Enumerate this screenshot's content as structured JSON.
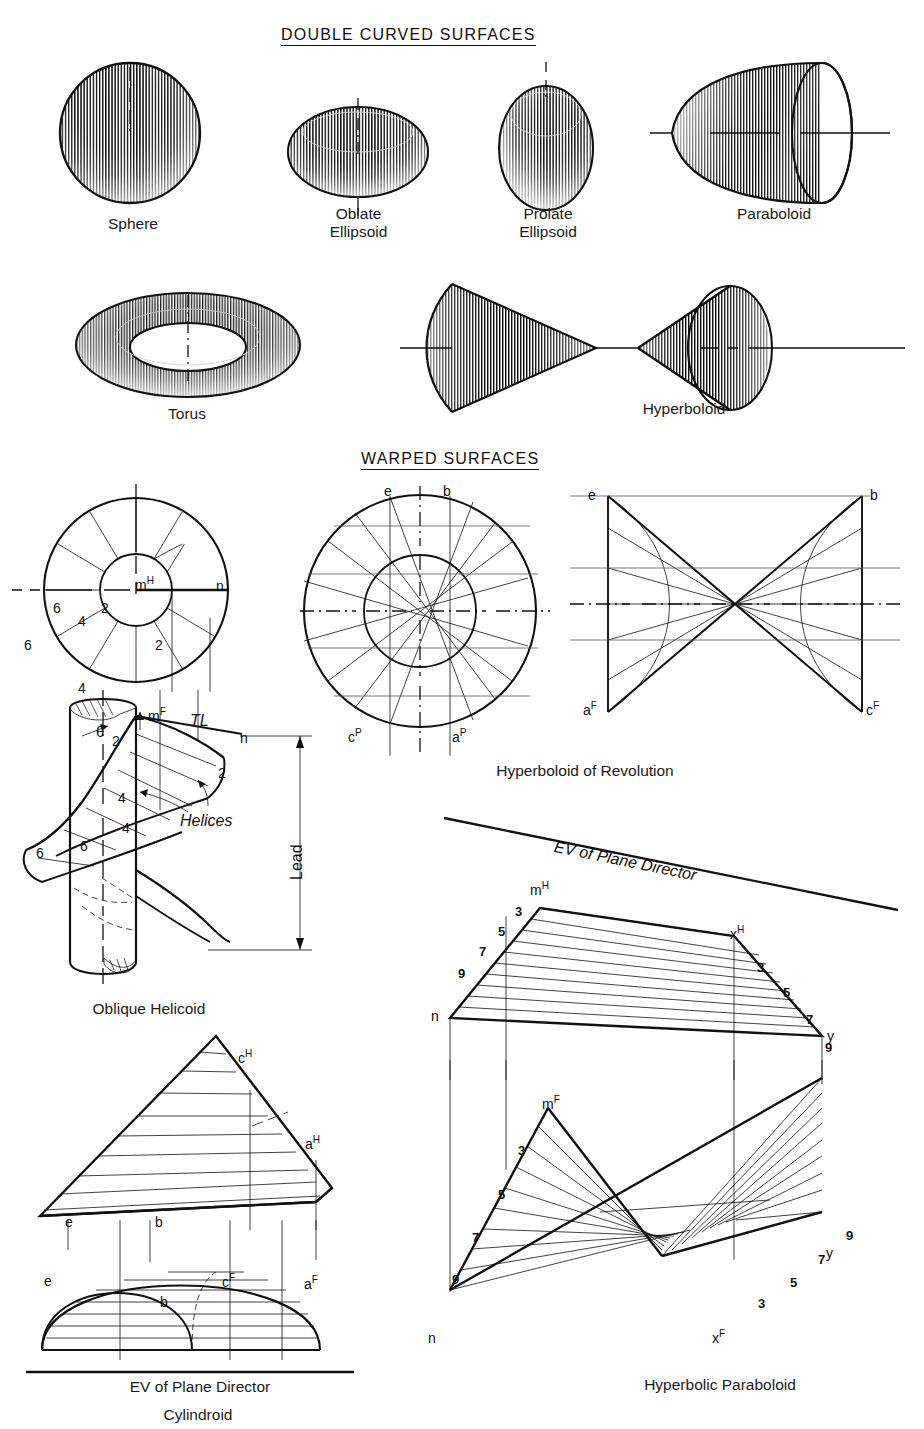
{
  "page": {
    "sections": [
      {
        "id": "double-curved",
        "title": "DOUBLE CURVED SURFACES"
      },
      {
        "id": "warped",
        "title": "WARPED SURFACES"
      }
    ]
  },
  "double_curved": {
    "title": "DOUBLE CURVED SURFACES",
    "figures": [
      {
        "name": "sphere",
        "caption": "Sphere"
      },
      {
        "name": "oblate-ellipsoid",
        "caption_line1": "Oblate",
        "caption_line2": "Ellipsoid"
      },
      {
        "name": "prolate-ellipsoid",
        "caption_line1": "Prolate",
        "caption_line2": "Ellipsoid"
      },
      {
        "name": "paraboloid",
        "caption": "Paraboloid"
      },
      {
        "name": "torus",
        "caption": "Torus"
      },
      {
        "name": "hyperboloid",
        "caption": "Hyperboloid"
      }
    ]
  },
  "warped": {
    "title": "WARPED SURFACES",
    "oblique_helicoid": {
      "caption": "Oblique Helicoid",
      "plan_labels": {
        "m": "m",
        "m_sup": "H",
        "n": "n"
      },
      "plan_numbers_inner": [
        "6",
        "2",
        "4"
      ],
      "plan_numbers_outer": [
        "6",
        "2",
        "4"
      ],
      "elev_labels": {
        "m": "m",
        "m_sup": "F",
        "n": "n",
        "tl": "TL",
        "theta": "θ",
        "helices": "Helices",
        "lead": "Lead"
      },
      "elev_numbers": [
        "2",
        "2",
        "4",
        "4",
        "6",
        "6"
      ]
    },
    "hyperboloid_of_revolution": {
      "caption": "Hyperboloid of Revolution",
      "plan_labels": [
        {
          "base": "e",
          "sup": ""
        },
        {
          "base": "b",
          "sup": ""
        },
        {
          "base": "c",
          "sup": "P"
        },
        {
          "base": "a",
          "sup": "P"
        }
      ],
      "elev_labels": [
        {
          "base": "e",
          "sup": ""
        },
        {
          "base": "b",
          "sup": ""
        },
        {
          "base": "a",
          "sup": "F"
        },
        {
          "base": "c",
          "sup": "F"
        }
      ]
    },
    "cylindroid": {
      "caption": "Cylindroid",
      "plane_director": "EV of Plane Director",
      "top_labels": [
        {
          "base": "c",
          "sup": "H"
        },
        {
          "base": "a",
          "sup": "H"
        },
        {
          "base": "e",
          "sup": ""
        },
        {
          "base": "b",
          "sup": ""
        }
      ],
      "front_labels": [
        {
          "base": "e",
          "sup": ""
        },
        {
          "base": "b",
          "sup": ""
        },
        {
          "base": "c",
          "sup": "F"
        },
        {
          "base": "a",
          "sup": "F"
        }
      ]
    },
    "hyperbolic_paraboloid": {
      "caption": "Hyperbolic Paraboloid",
      "plane_director": "EV of Plane Director",
      "top_labels": [
        {
          "base": "m",
          "sup": "H"
        },
        {
          "base": "x",
          "sup": "H"
        },
        {
          "base": "n",
          "sup": ""
        },
        {
          "base": "y",
          "sup": ""
        }
      ],
      "front_labels": [
        {
          "base": "m",
          "sup": "F"
        },
        {
          "base": "x",
          "sup": "F"
        },
        {
          "base": "n",
          "sup": ""
        },
        {
          "base": "y",
          "sup": ""
        }
      ],
      "top_left_numbers": [
        "3",
        "5",
        "7",
        "9"
      ],
      "top_right_numbers": [
        "3",
        "5",
        "7",
        "9"
      ],
      "front_left_numbers": [
        "3",
        "5",
        "7",
        "9"
      ],
      "front_right_numbers": [
        "3",
        "5",
        "7",
        "9"
      ]
    }
  },
  "colors": {
    "ink": "#111111",
    "thin_ink": "#555555",
    "paper": "#ffffff"
  }
}
